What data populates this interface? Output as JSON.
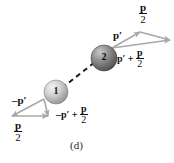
{
  "figure": {
    "caption": "(d)",
    "background_color": "#ffffff",
    "arrow_color": "#a8a8a8",
    "dashed_line_color": "#1a1a1a",
    "balls": [
      {
        "label": "1",
        "name": "ball-one",
        "fill_light": "#e8e8e8",
        "fill_dark": "#9a9a9a"
      },
      {
        "label": "2",
        "name": "ball-two",
        "fill_light": "#bdbdbd",
        "fill_dark": "#5c5c5c"
      }
    ],
    "labels": {
      "p_half_top": {
        "numerator": "p",
        "denominator": "2"
      },
      "p_prime_top": "p′",
      "sum_top_prefix": "p′ +",
      "sum_top_fraction": {
        "numerator": "p",
        "denominator": "2"
      },
      "neg_p_prime": "–p′",
      "sum_bottom_prefix": "–p′ +",
      "sum_bottom_fraction": {
        "numerator": "p",
        "denominator": "2"
      },
      "p_half_bottom": {
        "numerator": "p",
        "denominator": "2"
      }
    }
  }
}
